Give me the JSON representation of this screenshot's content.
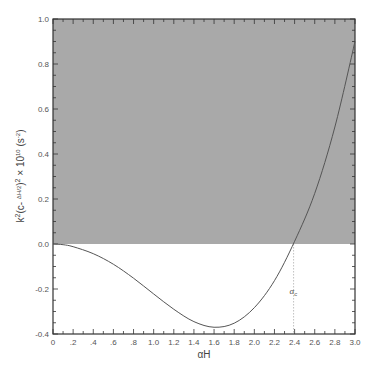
{
  "chart_data": {
    "type": "line",
    "title": "",
    "xlabel": "αH",
    "ylabel": "k²(c− ΔH/2)² × 10¹⁰ (s⁻²)",
    "ylabel_parts": {
      "main": "k",
      "sup1": "2",
      "open": "(c- ",
      "frac_num": "ΔH",
      "frac_den": "2",
      "close": ")",
      "sup2": "2",
      "times": " × 10",
      "sup3": "10",
      "unit": " (s",
      "sup4": "-2",
      "unit_close": ")"
    },
    "xlim": [
      0,
      3.0
    ],
    "ylim": [
      -0.4,
      1.0
    ],
    "x_ticks": [
      0,
      0.2,
      0.4,
      0.6,
      0.8,
      1.0,
      1.2,
      1.4,
      1.6,
      1.8,
      2.0,
      2.2,
      2.4,
      2.6,
      2.8,
      3.0
    ],
    "x_tick_labels": [
      "0",
      ".2",
      ".4",
      ".6",
      ".8",
      "1.0",
      "1.2",
      "1.4",
      "1.6",
      "1.8",
      "2.0",
      "2.2",
      "2.4",
      "2.6",
      "2.8",
      "3.0"
    ],
    "y_ticks": [
      -0.4,
      -0.2,
      0.0,
      0.2,
      0.4,
      0.6,
      0.8,
      1.0
    ],
    "y_tick_labels": [
      "-0.4",
      "-0.2",
      "0.0",
      "0.2",
      "0.4",
      "0.6",
      "0.8",
      "1.0"
    ],
    "shaded_region": {
      "y_from": 0.0,
      "y_to": 1.0,
      "color": "#a9a9a9"
    },
    "annotation": {
      "label": "α",
      "sub": "c",
      "x": 2.39
    },
    "series": [
      {
        "name": "curve",
        "color": "#555555",
        "x": [
          0,
          0.1,
          0.2,
          0.4,
          0.6,
          0.8,
          1.0,
          1.2,
          1.4,
          1.6,
          1.8,
          2.0,
          2.2,
          2.4,
          2.6,
          2.8,
          3.0
        ],
        "values": [
          0,
          -0.003,
          -0.012,
          -0.043,
          -0.09,
          -0.152,
          -0.222,
          -0.29,
          -0.345,
          -0.37,
          -0.352,
          -0.283,
          -0.163,
          0.012,
          0.225,
          0.52,
          0.9
        ]
      }
    ],
    "grid": false,
    "legend": null
  }
}
